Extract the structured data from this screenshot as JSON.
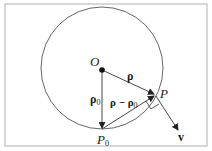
{
  "diagram": {
    "type": "vector-geometry",
    "frame": {
      "x": 5,
      "y": 4,
      "width": 202,
      "height": 142,
      "stroke": "#b0b0b0"
    },
    "circle": {
      "cx": 102,
      "cy": 68,
      "r": 61,
      "stroke": "#555555"
    },
    "points": {
      "O": {
        "x": 102,
        "y": 70,
        "label": "O"
      },
      "P": {
        "x": 155,
        "y": 95,
        "label": "P"
      },
      "P0": {
        "x": 102,
        "y": 129,
        "label_main": "P",
        "label_sub": "0"
      }
    },
    "vectors": {
      "rho": {
        "from": "O",
        "to": "P",
        "label": "ρ"
      },
      "rho0": {
        "from": "O",
        "to": "P0",
        "label_main": "ρ",
        "label_sub": "0"
      },
      "rho_minus_rho0": {
        "from": "P0",
        "to": "P",
        "label_a": "ρ − ρ",
        "label_sub": "0"
      },
      "v": {
        "from": "P",
        "to_x": 178,
        "to_y": 130,
        "label": "v"
      }
    },
    "colors": {
      "line": "#333333",
      "text": "#1a1a1a",
      "frame": "#b0b0b0"
    }
  }
}
